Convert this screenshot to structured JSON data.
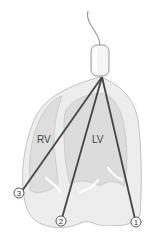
{
  "diagram": {
    "chambers": [
      {
        "id": "rv",
        "label": "RV"
      },
      {
        "id": "lv",
        "label": "LV"
      }
    ],
    "electrodes": [
      {
        "id": "1",
        "label": "1"
      },
      {
        "id": "2",
        "label": "2"
      },
      {
        "id": "3",
        "label": "3"
      }
    ],
    "colors": {
      "outline": "#b8b8b8",
      "heart_fill": "#ececec",
      "chamber_fill": "#dcdcdc",
      "lead": "#4a4a4a",
      "device_fill": "#f4f4f4",
      "background": "#ffffff"
    }
  }
}
